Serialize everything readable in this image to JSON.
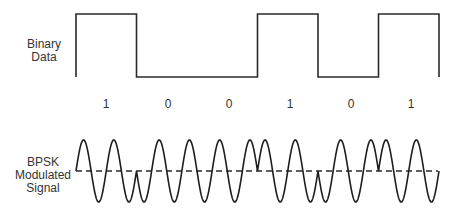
{
  "labels": {
    "binary_data": "Binary Data",
    "bpsk_signal": "BPSK Modulated Signal"
  },
  "colors": {
    "line": "#2a2a2a",
    "text": "#333333",
    "background": "#ffffff"
  },
  "chart_data": {
    "type": "diagram",
    "title": "",
    "bits": [
      "1",
      "0",
      "0",
      "1",
      "0",
      "1"
    ],
    "bit_values": [
      1,
      0,
      0,
      1,
      0,
      1
    ],
    "carrier_cycles_per_bit": 2,
    "modulation": "BPSK (phase flips 180° on bit change)",
    "dashed_reference_line": true,
    "rows": [
      {
        "name": "Binary Data",
        "kind": "square-wave"
      },
      {
        "name": "BPSK Modulated Signal",
        "kind": "sinusoid"
      }
    ]
  }
}
